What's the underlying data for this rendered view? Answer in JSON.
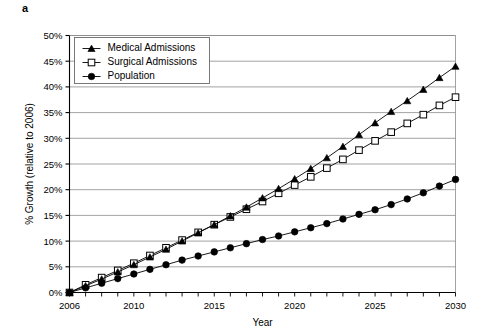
{
  "figure": {
    "panel_label": "a"
  },
  "chart_data": {
    "type": "line",
    "title": "",
    "xlabel": "Year",
    "ylabel": "% Growth (relative to 2006)",
    "xlim": [
      2006,
      2030
    ],
    "ylim": [
      0,
      50
    ],
    "grid": "horizontal",
    "legend_position": "top-left",
    "x_tick_labels": [
      "2006",
      "2010",
      "2015",
      "2020",
      "2025",
      "2030"
    ],
    "x_tick_values": [
      2006,
      2010,
      2015,
      2020,
      2025,
      2030
    ],
    "x_minor_tick_step": 1,
    "y_tick_labels": [
      "0%",
      "5%",
      "10%",
      "15%",
      "20%",
      "25%",
      "30%",
      "35%",
      "40%",
      "45%",
      "50%"
    ],
    "y_tick_values": [
      0,
      5,
      10,
      15,
      20,
      25,
      30,
      35,
      40,
      45,
      50
    ],
    "x": [
      2006,
      2007,
      2008,
      2009,
      2010,
      2011,
      2012,
      2013,
      2014,
      2015,
      2016,
      2017,
      2018,
      2019,
      2020,
      2021,
      2022,
      2023,
      2024,
      2025,
      2026,
      2027,
      2028,
      2029,
      2030
    ],
    "series": [
      {
        "name": "Medical Admissions",
        "marker": "filled-triangle",
        "color": "#000000",
        "values": [
          0.0,
          1.3,
          2.6,
          4.0,
          5.4,
          6.9,
          8.4,
          10.0,
          11.6,
          13.2,
          14.9,
          16.6,
          18.4,
          20.2,
          22.1,
          24.1,
          26.2,
          28.4,
          30.7,
          33.0,
          35.2,
          37.3,
          39.5,
          41.8,
          44.0
        ]
      },
      {
        "name": "Surgical Admissions",
        "marker": "open-square",
        "color": "#000000",
        "values": [
          0.0,
          1.5,
          2.9,
          4.3,
          5.7,
          7.2,
          8.7,
          10.2,
          11.7,
          13.2,
          14.7,
          16.2,
          17.7,
          19.3,
          20.9,
          22.5,
          24.2,
          25.9,
          27.7,
          29.5,
          31.2,
          32.9,
          34.6,
          36.4,
          38.0
        ]
      },
      {
        "name": "Population",
        "marker": "filled-circle",
        "color": "#000000",
        "values": [
          0.0,
          0.9,
          1.8,
          2.7,
          3.6,
          4.5,
          5.4,
          6.3,
          7.1,
          7.9,
          8.7,
          9.5,
          10.3,
          11.0,
          11.8,
          12.6,
          13.4,
          14.3,
          15.2,
          16.1,
          17.1,
          18.2,
          19.4,
          20.7,
          22.0
        ]
      }
    ]
  }
}
